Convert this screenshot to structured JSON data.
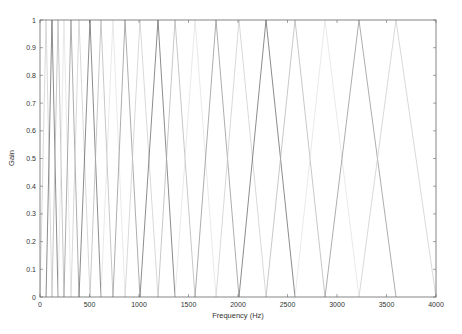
{
  "chart_data": {
    "type": "line",
    "title": "",
    "xlabel": "Frequency (Hz)",
    "ylabel": "Gain",
    "xlim": [
      0,
      4000
    ],
    "ylim": [
      0,
      1
    ],
    "grid": false,
    "legend": null,
    "x_ticks": [
      0,
      500,
      1000,
      1500,
      2000,
      2500,
      3000,
      3500,
      4000
    ],
    "x_tick_labels": [
      "0",
      "500",
      "1000",
      "1500",
      "2000",
      "2500",
      "3000",
      "3500",
      "4000"
    ],
    "y_ticks": [
      0,
      0.1,
      0.2,
      0.3,
      0.4,
      0.5,
      0.6,
      0.7,
      0.8,
      0.9,
      1
    ],
    "y_tick_labels": [
      "0",
      "0.1",
      "0.2",
      "0.3",
      "0.4",
      "0.5",
      "0.6",
      "0.7",
      "0.8",
      "0.9",
      "1"
    ],
    "filter_edges_hz": [
      0,
      61,
      121,
      182,
      242,
      313,
      394,
      505,
      616,
      737,
      859,
      1010,
      1192,
      1364,
      1566,
      1778,
      2010,
      2283,
      2576,
      2879,
      3222,
      3596,
      4000
    ],
    "filter_centers_hz": [
      61,
      121,
      182,
      242,
      313,
      394,
      505,
      616,
      737,
      859,
      1010,
      1192,
      1364,
      1566,
      1778,
      2010,
      2283,
      2576,
      2879,
      3222,
      3596
    ],
    "num_filters": 21,
    "line_colors": [
      "#8a8a8a",
      "#c8c8c8",
      "#5a5a5a",
      "#b0b0b0",
      "#e0e0e0"
    ]
  }
}
